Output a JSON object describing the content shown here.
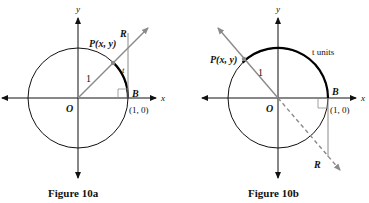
{
  "figures": [
    {
      "caption": "Figure 10a",
      "axis_x": "x",
      "axis_y": "y",
      "origin": "O",
      "point_p": "P(x, y)",
      "point_r": "R",
      "point_b": "B",
      "coord_b": "(1, 0)",
      "radius_label": "1",
      "arc_label": "t"
    },
    {
      "caption": "Figure 10b",
      "axis_x": "x",
      "axis_y": "y",
      "origin": "O",
      "point_p": "P(x, y)",
      "point_r": "R",
      "point_b": "B",
      "coord_b": "(1, 0)",
      "radius_label": "1",
      "arc_label": "t units"
    }
  ],
  "colors": {
    "axis": "#111111",
    "circle": "#111111",
    "ray": "#8a8a8a",
    "arc_highlight": "#000000"
  }
}
